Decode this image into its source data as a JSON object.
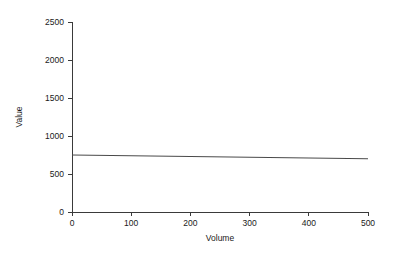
{
  "chart_data": {
    "type": "line",
    "title": "",
    "xlabel": "Volume",
    "ylabel": "Value",
    "xlim": [
      0,
      500
    ],
    "ylim": [
      0,
      2500
    ],
    "xticks": [
      0,
      100,
      200,
      300,
      400,
      500
    ],
    "yticks": [
      0,
      500,
      1000,
      1500,
      2000,
      2500
    ],
    "xticklabels": [
      "0",
      "100",
      "200",
      "300",
      "400",
      "500"
    ],
    "yticklabels": [
      "0",
      "500",
      "1000",
      "1500",
      "2000",
      "2500"
    ],
    "grid": false,
    "legend": false,
    "legend_position": "none",
    "series": [
      {
        "name": "Value",
        "color": "#4a4a4a",
        "x": [
          0,
          100,
          200,
          300,
          400,
          500
        ],
        "values": [
          750,
          740,
          730,
          720,
          710,
          700
        ]
      }
    ]
  },
  "axes": {
    "y_title": "Value",
    "x_title": "Volume"
  }
}
